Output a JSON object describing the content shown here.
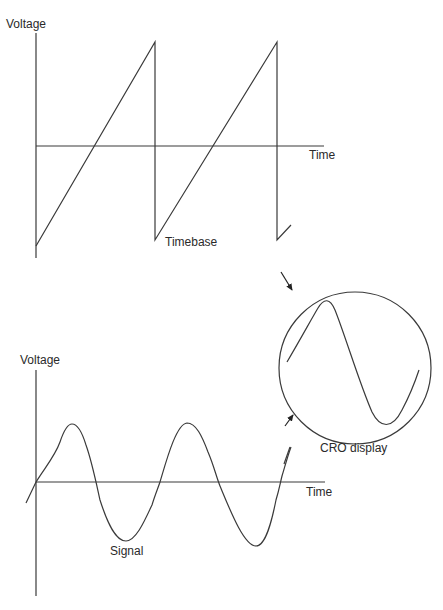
{
  "colors": {
    "line": "#3a3a3a",
    "text": "#2a2a2a",
    "background": "#ffffff"
  },
  "timebase_graph": {
    "y_axis_label": "Voltage",
    "x_axis_label": "Time",
    "waveform_label": "Timebase",
    "waveform_type": "sawtooth"
  },
  "signal_graph": {
    "y_axis_label": "Voltage",
    "x_axis_label": "Time",
    "waveform_label": "Signal",
    "waveform_type": "sine"
  },
  "cro": {
    "label": "CRO display",
    "shows": "one cycle of signal"
  }
}
